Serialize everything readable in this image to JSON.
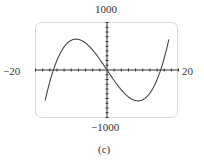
{
  "labels": {
    "y_max": "1000",
    "y_min": "−1000",
    "x_min": "−20",
    "x_max": "20",
    "caption": "(c)"
  },
  "colors": {
    "curve": "#444444",
    "frame": "#d8d8d8",
    "axis": "#333333"
  },
  "chart_data": {
    "type": "line",
    "title": "",
    "caption": "(c)",
    "xlabel": "",
    "ylabel": "",
    "xlim": [
      -20,
      20
    ],
    "ylim": [
      -1000,
      1000
    ],
    "x_tick_labels": [
      "-20",
      "20"
    ],
    "y_tick_labels": [
      "-1000",
      "1000"
    ],
    "x_tick_step": 2,
    "y_tick_step": 100,
    "grid": false,
    "series": [
      {
        "name": "cubic",
        "description": "cubic with roots near x=-15, 0, 15; local max ~650 near x=-8.7, local min ~-650 near x=8.7",
        "x": [
          -17,
          -15,
          -12,
          -8.7,
          -5,
          0,
          5,
          8.7,
          12,
          15,
          17
        ],
        "y": [
          -1000,
          0,
          486,
          650,
          500,
          0,
          -500,
          -650,
          -486,
          0,
          1000
        ]
      }
    ]
  }
}
